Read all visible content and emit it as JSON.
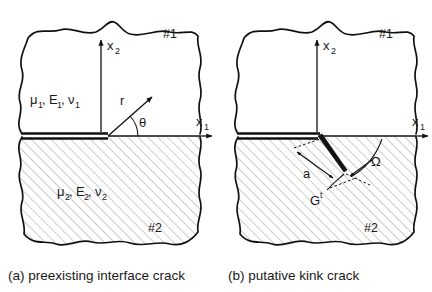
{
  "figure": {
    "background_color": "#ffffff",
    "line_color": "#111111",
    "hatch_color": "#9a9a9a"
  },
  "panel_a": {
    "caption": "(a) preexisting interface crack",
    "upper_region_tag": "#1",
    "lower_region_tag": "#2",
    "upper_material_mu": "μ",
    "upper_material_mu_sub": "1",
    "upper_material_E": "E",
    "upper_material_E_sub": "1",
    "upper_material_nu": "ν",
    "upper_material_nu_sub": "1",
    "lower_material_mu": "μ",
    "lower_material_mu_sub": "2",
    "lower_material_E": "E",
    "lower_material_E_sub": "2",
    "lower_material_nu": "ν",
    "lower_material_nu_sub": "2",
    "axis_x1": "x",
    "axis_x1_sub": "1",
    "axis_x2": "x",
    "axis_x2_sub": "2",
    "radial_label": "r",
    "angle_label": "θ",
    "comma": ","
  },
  "panel_b": {
    "caption": "(b) putative kink crack",
    "upper_region_tag": "#1",
    "lower_region_tag": "#2",
    "axis_x1": "x",
    "axis_x1_sub": "1",
    "axis_x2": "x",
    "axis_x2_sub": "2",
    "kink_length_label": "a",
    "energy_release_label": "G",
    "energy_release_sup": "t",
    "kink_angle_label": "Ω"
  }
}
